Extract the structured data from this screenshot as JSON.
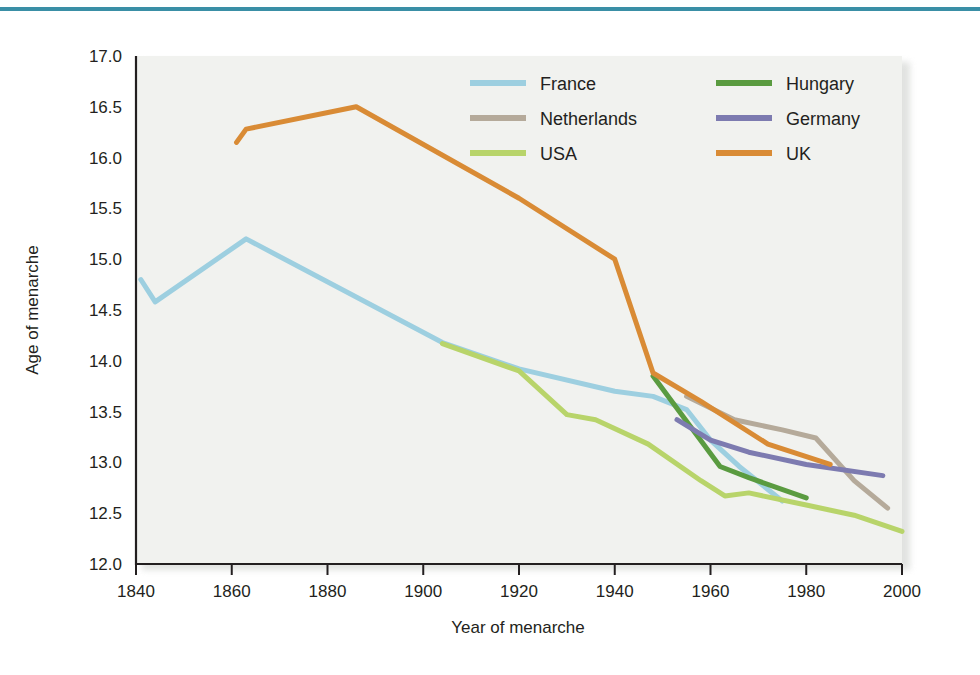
{
  "figure": {
    "background_color": "#ffffff",
    "plot_background_color": "#f1f2ef",
    "rule_color": "#3a8fa6"
  },
  "chart_data": {
    "type": "line",
    "title": "",
    "subtitle": "",
    "xlabel": "Year of menarche",
    "ylabel": "Age of menarche",
    "xlim": [
      1840,
      2000
    ],
    "ylim": [
      12.0,
      17.0
    ],
    "xticks": [
      1840,
      1860,
      1880,
      1900,
      1920,
      1940,
      1960,
      1980,
      2000
    ],
    "xtick_labels": [
      "1840",
      "1860",
      "1880",
      "1900",
      "1920",
      "1940",
      "1960",
      "1980",
      "2000"
    ],
    "yticks": [
      12.0,
      12.5,
      13.0,
      13.5,
      14.0,
      14.5,
      15.0,
      15.5,
      16.0,
      16.5,
      17.0
    ],
    "ytick_labels": [
      "12.0",
      "12.5",
      "13.0",
      "13.5",
      "14.0",
      "14.5",
      "15.0",
      "15.5",
      "16.0",
      "16.5",
      "17.0"
    ],
    "grid": false,
    "legend_position": "top-right",
    "series": [
      {
        "name": "France",
        "color": "#9dcfe0",
        "x": [
          1841,
          1844,
          1863,
          1904,
          1920,
          1940,
          1948,
          1955,
          1960,
          1966,
          1975
        ],
        "y": [
          14.8,
          14.58,
          15.2,
          14.18,
          13.92,
          13.7,
          13.65,
          13.52,
          13.22,
          12.96,
          12.62
        ]
      },
      {
        "name": "Netherlands",
        "color": "#b5aa9a",
        "x": [
          1955,
          1965,
          1975,
          1982,
          1990,
          1997
        ],
        "y": [
          13.65,
          13.42,
          13.32,
          13.24,
          12.82,
          12.55
        ]
      },
      {
        "name": "USA",
        "color": "#b8d46a",
        "x": [
          1904,
          1920,
          1930,
          1936,
          1947,
          1958,
          1963,
          1968,
          1980,
          1990,
          2000
        ],
        "y": [
          14.17,
          13.9,
          13.47,
          13.42,
          13.18,
          12.82,
          12.67,
          12.7,
          12.58,
          12.48,
          12.32
        ]
      },
      {
        "name": "Hungary",
        "color": "#5a9b40",
        "x": [
          1948,
          1962,
          1968,
          1980
        ],
        "y": [
          13.85,
          12.96,
          12.85,
          12.65
        ]
      },
      {
        "name": "Germany",
        "color": "#7d7bb0",
        "x": [
          1953,
          1960,
          1968,
          1980,
          1996
        ],
        "y": [
          13.42,
          13.22,
          13.1,
          12.98,
          12.87
        ]
      },
      {
        "name": "UK",
        "color": "#d98b35",
        "x": [
          1861,
          1863,
          1886,
          1920,
          1940,
          1948,
          1958,
          1972,
          1985
        ],
        "y": [
          16.15,
          16.28,
          16.5,
          15.6,
          15.0,
          13.88,
          13.6,
          13.18,
          12.98
        ]
      }
    ],
    "legend": [
      {
        "label": "France",
        "color": "#9dcfe0",
        "column": 0,
        "row": 0
      },
      {
        "label": "Netherlands",
        "color": "#b5aa9a",
        "column": 0,
        "row": 1
      },
      {
        "label": "USA",
        "color": "#b8d46a",
        "column": 0,
        "row": 2
      },
      {
        "label": "Hungary",
        "color": "#5a9b40",
        "column": 1,
        "row": 0
      },
      {
        "label": "Germany",
        "color": "#7d7bb0",
        "column": 1,
        "row": 1
      },
      {
        "label": "UK",
        "color": "#d98b35",
        "column": 1,
        "row": 2
      }
    ]
  }
}
